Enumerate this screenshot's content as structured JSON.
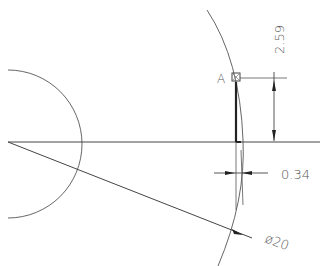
{
  "drawing": {
    "point_label": "A",
    "dimensions": {
      "vertical": "2.59",
      "horizontal": "0.34",
      "diameter": "ø20"
    },
    "colors": {
      "line": "#333333",
      "text": "#555555",
      "background": "#ffffff"
    }
  }
}
